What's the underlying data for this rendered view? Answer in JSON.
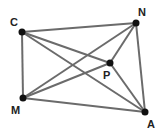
{
  "diagram": {
    "type": "geometry",
    "points": [
      {
        "id": "C",
        "label": "C",
        "x": 22,
        "y": 32,
        "lx": 10,
        "ly": 26
      },
      {
        "id": "N",
        "label": "N",
        "x": 136,
        "y": 23,
        "lx": 138,
        "ly": 16
      },
      {
        "id": "M",
        "label": "M",
        "x": 23,
        "y": 98,
        "lx": 11,
        "ly": 114
      },
      {
        "id": "A",
        "label": "A",
        "x": 145,
        "y": 112,
        "lx": 147,
        "ly": 128
      },
      {
        "id": "P",
        "label": "P",
        "x": 110,
        "y": 63,
        "lx": 103,
        "ly": 79
      }
    ],
    "segments": [
      [
        "C",
        "N"
      ],
      [
        "C",
        "M"
      ],
      [
        "M",
        "A"
      ],
      [
        "N",
        "A"
      ],
      [
        "C",
        "A"
      ],
      [
        "C",
        "P"
      ],
      [
        "M",
        "N"
      ],
      [
        "M",
        "P"
      ],
      [
        "N",
        "P"
      ],
      [
        "P",
        "A"
      ]
    ],
    "colors": {
      "edge": "#6b6b6b",
      "vertex": "#111111",
      "label": "#222222"
    }
  }
}
